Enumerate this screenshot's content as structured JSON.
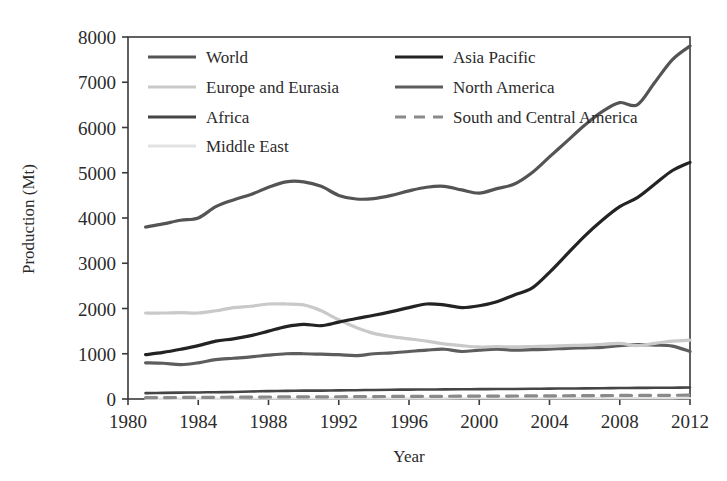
{
  "chart_data": {
    "type": "line",
    "title": "",
    "xlabel": "Year",
    "ylabel": "Production (Mt)",
    "xlim": [
      1980,
      2012
    ],
    "ylim": [
      0,
      8000
    ],
    "xticks": [
      1980,
      1984,
      1988,
      1992,
      1996,
      2000,
      2004,
      2008,
      2012
    ],
    "yticks": [
      0,
      1000,
      2000,
      3000,
      4000,
      5000,
      6000,
      7000,
      8000
    ],
    "grid": false,
    "legend_position": "upper-left-inside",
    "x": [
      1981,
      1982,
      1983,
      1984,
      1985,
      1986,
      1987,
      1988,
      1989,
      1990,
      1991,
      1992,
      1993,
      1994,
      1995,
      1996,
      1997,
      1998,
      1999,
      2000,
      2001,
      2002,
      2003,
      2004,
      2005,
      2006,
      2007,
      2008,
      2009,
      2010,
      2011,
      2012
    ],
    "series": [
      {
        "name": "World",
        "color": "#545454",
        "dash": "solid",
        "width": 3.2,
        "values": [
          3800,
          3870,
          3950,
          4000,
          4250,
          4400,
          4520,
          4680,
          4800,
          4800,
          4700,
          4500,
          4420,
          4430,
          4500,
          4600,
          4680,
          4700,
          4620,
          4550,
          4650,
          4750,
          5000,
          5350,
          5700,
          6050,
          6350,
          6550,
          6500,
          7000,
          7500,
          7800
        ]
      },
      {
        "name": "Asia Pacific",
        "color": "#232323",
        "dash": "solid",
        "width": 3.2,
        "values": [
          980,
          1030,
          1100,
          1180,
          1280,
          1330,
          1400,
          1500,
          1600,
          1650,
          1620,
          1700,
          1780,
          1850,
          1930,
          2020,
          2100,
          2080,
          2020,
          2060,
          2150,
          2300,
          2450,
          2800,
          3200,
          3600,
          3950,
          4250,
          4450,
          4750,
          5050,
          5230
        ]
      },
      {
        "name": "Europe and Eurasia",
        "color": "#c9c9c9",
        "dash": "solid",
        "width": 3.2,
        "values": [
          1900,
          1900,
          1910,
          1900,
          1950,
          2020,
          2050,
          2100,
          2100,
          2080,
          1950,
          1750,
          1580,
          1450,
          1380,
          1330,
          1280,
          1220,
          1180,
          1150,
          1160,
          1150,
          1160,
          1170,
          1180,
          1190,
          1210,
          1230,
          1180,
          1230,
          1280,
          1300
        ]
      },
      {
        "name": "North America",
        "color": "#5d5d5d",
        "dash": "solid",
        "width": 3.2,
        "values": [
          800,
          790,
          760,
          800,
          870,
          900,
          930,
          970,
          1000,
          1000,
          990,
          980,
          960,
          1000,
          1020,
          1050,
          1080,
          1100,
          1050,
          1080,
          1100,
          1080,
          1090,
          1100,
          1120,
          1130,
          1140,
          1180,
          1200,
          1190,
          1170,
          1050
        ]
      },
      {
        "name": "Africa",
        "color": "#454545",
        "dash": "solid",
        "width": 2.6,
        "values": [
          130,
          135,
          140,
          145,
          150,
          155,
          165,
          175,
          180,
          185,
          185,
          190,
          195,
          200,
          205,
          208,
          210,
          212,
          215,
          218,
          220,
          222,
          225,
          230,
          232,
          235,
          238,
          242,
          245,
          248,
          250,
          255
        ]
      },
      {
        "name": "South and Central America",
        "color": "#8a8a8a",
        "dash": "dashed",
        "width": 3.2,
        "values": [
          30,
          32,
          34,
          36,
          38,
          40,
          42,
          44,
          46,
          48,
          48,
          50,
          52,
          54,
          56,
          58,
          60,
          60,
          62,
          64,
          64,
          66,
          68,
          70,
          72,
          74,
          76,
          78,
          78,
          80,
          82,
          84
        ]
      },
      {
        "name": "Middle East",
        "color": "#e2e2e2",
        "dash": "solid",
        "width": 2.4,
        "values": [
          5,
          5,
          6,
          6,
          7,
          7,
          8,
          8,
          9,
          9,
          9,
          10,
          10,
          11,
          11,
          12,
          12,
          12,
          13,
          13,
          13,
          14,
          14,
          15,
          15,
          16,
          16,
          17,
          17,
          18,
          18,
          19
        ]
      }
    ]
  },
  "legend": {
    "entries": [
      {
        "label": "World",
        "color": "#545454",
        "dash": "solid",
        "col": 0,
        "row": 0
      },
      {
        "label": "Asia Pacific",
        "color": "#232323",
        "dash": "solid",
        "col": 1,
        "row": 0
      },
      {
        "label": "Europe and Eurasia",
        "color": "#c9c9c9",
        "dash": "solid",
        "col": 0,
        "row": 1
      },
      {
        "label": "North America",
        "color": "#5d5d5d",
        "dash": "solid",
        "col": 1,
        "row": 1
      },
      {
        "label": "Africa",
        "color": "#454545",
        "dash": "solid",
        "col": 0,
        "row": 2
      },
      {
        "label": "South and Central America",
        "color": "#8a8a8a",
        "dash": "dashed",
        "col": 1,
        "row": 2
      },
      {
        "label": "Middle East",
        "color": "#e2e2e2",
        "dash": "solid",
        "col": 0,
        "row": 3
      }
    ]
  }
}
